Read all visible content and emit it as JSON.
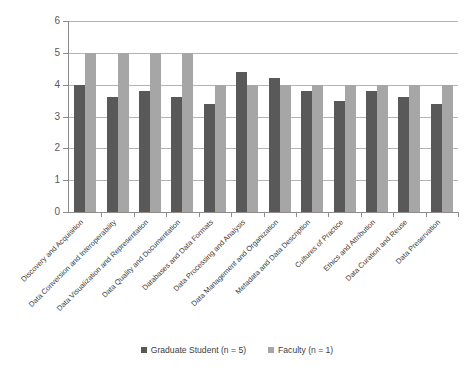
{
  "chart_data": {
    "type": "bar",
    "title": "",
    "subtitle": "",
    "xlabel": "",
    "ylabel": "",
    "ylim": [
      0,
      6
    ],
    "y_ticks": [
      0,
      1,
      2,
      3,
      4,
      5,
      6
    ],
    "grid": true,
    "legend_position": "bottom",
    "categories": [
      "Discovery and Acquisition",
      "Data Conversion and Interoperability",
      "Data Visualization and Representation",
      "Data Quality and Documentation",
      "Databases and Data Formats",
      "Data Processing and Analysis",
      "Data Management and Organization",
      "Metadata and Data Description",
      "Cultures of Practice",
      "Ethics and Attribution",
      "Data Curation and Reuse",
      "Data Preservation"
    ],
    "series": [
      {
        "name": "Graduate Student (n = 5)",
        "color": "#595959",
        "values": [
          4.0,
          3.6,
          3.8,
          3.6,
          3.4,
          4.4,
          4.2,
          3.8,
          3.5,
          3.8,
          3.6,
          3.4
        ]
      },
      {
        "name": "Faculty (n = 1)",
        "color": "#a6a6a6",
        "values": [
          5.0,
          5.0,
          5.0,
          5.0,
          4.0,
          4.0,
          4.0,
          4.0,
          4.0,
          4.0,
          4.0,
          4.0
        ]
      }
    ]
  },
  "axis": {
    "y_tick_labels": [
      "0",
      "1",
      "2",
      "3",
      "4",
      "5",
      "6"
    ]
  },
  "legend": {
    "items": [
      {
        "label": "Graduate Student (n = 5)"
      },
      {
        "label": "Faculty (n = 1)"
      }
    ]
  }
}
